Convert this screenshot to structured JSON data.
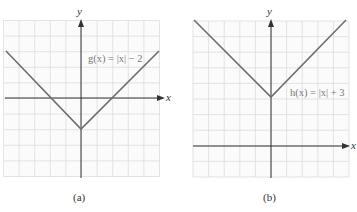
{
  "colors": {
    "grid": "#dcdcdc",
    "grid_bg": "#fbfbfb",
    "axis": "#333333",
    "curve": "#6e6e6e",
    "label": "#777777"
  },
  "chart_data": [
    {
      "type": "line",
      "title": "",
      "caption": "(a)",
      "function_label": "g(x) = |x| − 2",
      "xlabel": "x",
      "ylabel": "y",
      "xlim": [
        -5,
        5
      ],
      "ylim": [
        -5,
        5
      ],
      "grid": true,
      "grid_step": 1,
      "series": [
        {
          "name": "g(x) = |x| − 2",
          "x": [
            -5,
            -4,
            -3,
            -2,
            -1,
            0,
            1,
            2,
            3,
            4,
            5
          ],
          "y": [
            3,
            2,
            1,
            0,
            -1,
            -2,
            -1,
            0,
            1,
            2,
            3
          ]
        }
      ],
      "annotations": [
        {
          "text": "g(x) = |x| − 2",
          "x": 0.5,
          "y": 2.5
        }
      ]
    },
    {
      "type": "line",
      "title": "",
      "caption": "(b)",
      "function_label": "h(x) = |x| + 3",
      "xlabel": "x",
      "ylabel": "y",
      "xlim": [
        -5,
        5
      ],
      "ylim": [
        -2,
        8
      ],
      "grid": true,
      "grid_step": 1,
      "series": [
        {
          "name": "h(x) = |x| + 3",
          "x": [
            -5,
            -4,
            -3,
            -2,
            -1,
            0,
            1,
            2,
            3,
            4,
            5
          ],
          "y": [
            8,
            7,
            6,
            5,
            4,
            3,
            4,
            5,
            6,
            7,
            8
          ]
        }
      ],
      "annotations": [
        {
          "text": "h(x) = |x| + 3",
          "x": 1.2,
          "y": 3.2
        }
      ]
    }
  ]
}
